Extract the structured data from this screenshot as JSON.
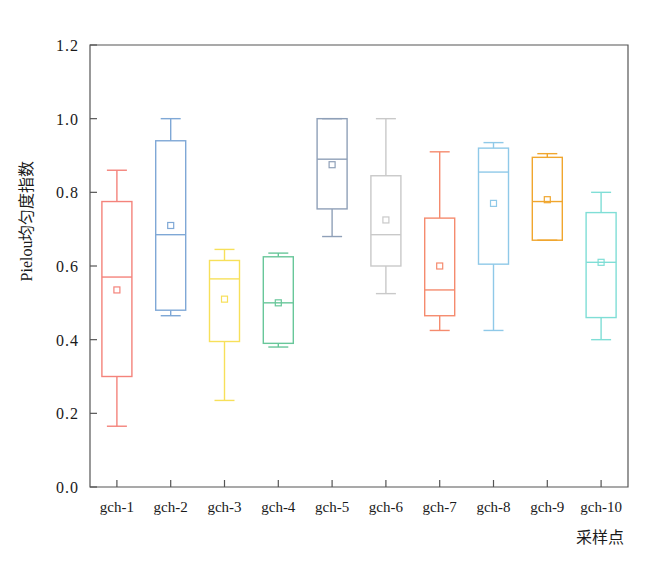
{
  "chart_data": {
    "type": "box",
    "title": "",
    "xlabel": "采样点",
    "ylabel": "Pielou均匀度指数",
    "ylim": [
      0.0,
      1.2
    ],
    "yticks": [
      "0.0",
      "0.2",
      "0.4",
      "0.6",
      "0.8",
      "1.0",
      "1.2"
    ],
    "ytick_values": [
      0.0,
      0.2,
      0.4,
      0.6,
      0.8,
      1.0,
      1.2
    ],
    "grid": false,
    "legend": "none",
    "categories": [
      "gch-1",
      "gch-2",
      "gch-3",
      "gch-4",
      "gch-5",
      "gch-6",
      "gch-7",
      "gch-8",
      "gch-9",
      "gch-10"
    ],
    "boxes": [
      {
        "category": "gch-1",
        "whisker_low": 0.165,
        "q1": 0.3,
        "median": 0.57,
        "q3": 0.775,
        "whisker_high": 0.86,
        "mean": 0.535,
        "color": "#f4837b"
      },
      {
        "category": "gch-2",
        "whisker_low": 0.465,
        "q1": 0.48,
        "median": 0.685,
        "q3": 0.94,
        "whisker_high": 1.0,
        "mean": 0.71,
        "color": "#7fa8d6"
      },
      {
        "category": "gch-3",
        "whisker_low": 0.235,
        "q1": 0.395,
        "median": 0.565,
        "q3": 0.615,
        "whisker_high": 0.645,
        "mean": 0.51,
        "color": "#f7e05a"
      },
      {
        "category": "gch-4",
        "whisker_low": 0.38,
        "q1": 0.39,
        "median": 0.5,
        "q3": 0.625,
        "whisker_high": 0.635,
        "mean": 0.5,
        "color": "#68c79a"
      },
      {
        "category": "gch-5",
        "whisker_low": 0.68,
        "q1": 0.755,
        "median": 0.89,
        "q3": 1.0,
        "whisker_high": 1.0,
        "mean": 0.875,
        "color": "#8fa0b8"
      },
      {
        "category": "gch-6",
        "whisker_low": 0.525,
        "q1": 0.6,
        "median": 0.685,
        "q3": 0.845,
        "whisker_high": 1.0,
        "mean": 0.725,
        "color": "#c9c9c9"
      },
      {
        "category": "gch-7",
        "whisker_low": 0.425,
        "q1": 0.465,
        "median": 0.535,
        "q3": 0.73,
        "whisker_high": 0.91,
        "mean": 0.6,
        "color": "#f58b6e"
      },
      {
        "category": "gch-8",
        "whisker_low": 0.425,
        "q1": 0.605,
        "median": 0.855,
        "q3": 0.92,
        "whisker_high": 0.935,
        "mean": 0.77,
        "color": "#8fc9e8"
      },
      {
        "category": "gch-9",
        "whisker_low": 0.67,
        "q1": 0.67,
        "median": 0.775,
        "q3": 0.895,
        "whisker_high": 0.905,
        "mean": 0.78,
        "color": "#f0a62e"
      },
      {
        "category": "gch-10",
        "whisker_low": 0.4,
        "q1": 0.46,
        "median": 0.61,
        "q3": 0.745,
        "whisker_high": 0.8,
        "mean": 0.61,
        "color": "#7fded6"
      }
    ]
  },
  "axes": {
    "frame_color": "#555555",
    "background": "#ffffff"
  }
}
